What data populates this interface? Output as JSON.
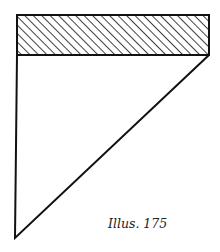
{
  "figure": {
    "caption": "Illus. 175",
    "stroke_color": "#111111",
    "background": "#ffffff",
    "hatched_rectangle": {
      "x": 17,
      "y": 15,
      "width": 192,
      "height": 40,
      "hatch": "diagonal"
    },
    "triangle": {
      "points": [
        [
          17,
          55
        ],
        [
          209,
          55
        ],
        [
          15,
          238
        ]
      ]
    }
  }
}
